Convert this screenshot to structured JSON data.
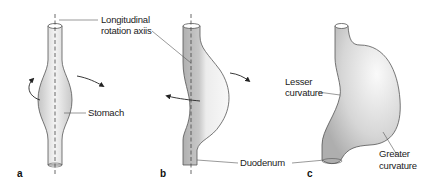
{
  "figure": {
    "type": "anatomical diagram",
    "colors": {
      "outline": "#555555",
      "fill_dark": "#b8b8b8",
      "fill_light": "#f2f2f2",
      "text": "#222222",
      "axis": "#444444"
    }
  },
  "labels": {
    "axis_line1": "Longitudinal",
    "axis_line2": "rotation axiis",
    "stomach": "Stomach",
    "duodenum": "Duodenum",
    "lesser_line1": "Lesser",
    "lesser_line2": "curvature",
    "greater_line1": "Greater",
    "greater_line2": "curvature"
  },
  "panels": [
    {
      "id": "a",
      "label": "a"
    },
    {
      "id": "b",
      "label": "b"
    },
    {
      "id": "c",
      "label": "c"
    }
  ]
}
